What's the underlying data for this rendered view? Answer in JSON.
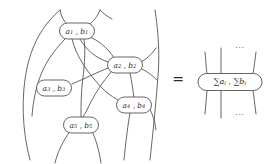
{
  "figure": {
    "kind": "string-diagram-identity",
    "equals_sign": "=",
    "stroke_color": "#4a4a4a",
    "background_color": "#ffffff"
  },
  "left_diagram": {
    "name": "tangled-node-network",
    "nodes": [
      {
        "id": "n1",
        "label_a": "a",
        "label_a_sub": "1",
        "separator": " , ",
        "label_b": "b",
        "label_b_sub": "1",
        "cx": 77,
        "cy": 31,
        "rx": 17.5,
        "ry": 8.0
      },
      {
        "id": "n2",
        "label_a": "a",
        "label_a_sub": "2",
        "separator": " , ",
        "label_b": "b",
        "label_b_sub": "2",
        "cx": 125,
        "cy": 65,
        "rx": 17.5,
        "ry": 8.0
      },
      {
        "id": "n3",
        "label_a": "a",
        "label_a_sub": "3",
        "separator": " , ",
        "label_b": "b",
        "label_b_sub": "3",
        "cx": 54,
        "cy": 88,
        "rx": 17.5,
        "ry": 8.0
      },
      {
        "id": "n4",
        "label_a": "a",
        "label_a_sub": "4",
        "separator": " , ",
        "label_b": "b",
        "label_b_sub": "4",
        "cx": 134,
        "cy": 105,
        "rx": 17.5,
        "ry": 8.0
      },
      {
        "id": "n5",
        "label_a": "a",
        "label_a_sub": "5",
        "separator": " , ",
        "label_b": "b",
        "label_b_sub": "5",
        "cx": 81,
        "cy": 125,
        "rx": 17.5,
        "ry": 8.0
      }
    ]
  },
  "right_diagram": {
    "name": "summed-node",
    "node": {
      "sum_symbol": "∑",
      "label_a": "a",
      "label_a_sub": "i",
      "separator": " , ",
      "label_b": "b",
      "label_b_sub": "i",
      "cx": 230,
      "cy": 82,
      "rx": 32,
      "ry": 8.5
    },
    "dots_top": "···",
    "dots_bottom": "···"
  }
}
